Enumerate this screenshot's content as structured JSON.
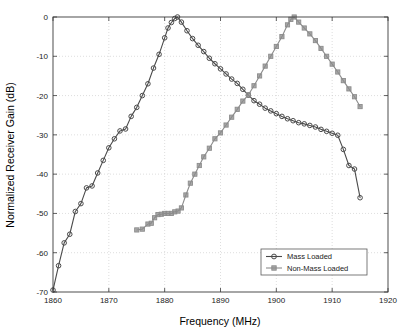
{
  "chart_data": {
    "type": "line",
    "title": "",
    "xlabel": "Frequency (MHz)",
    "ylabel": "Normalized Receiver Gain (dB)",
    "xlim": [
      1860,
      1920
    ],
    "ylim": [
      -70,
      0
    ],
    "xticks": [
      1860,
      1870,
      1880,
      1890,
      1900,
      1910,
      1920
    ],
    "yticks": [
      0,
      -10,
      -20,
      -30,
      -40,
      -50,
      -60,
      -70
    ],
    "xtick_labels": [
      "1860",
      "1870",
      "1880",
      "1890",
      "1900",
      "1910",
      "1920"
    ],
    "ytick_labels": [
      "0",
      "-10",
      "-20",
      "-30",
      "-40",
      "-50",
      "-60",
      "-70"
    ],
    "grid": true,
    "legend_position": "lower right",
    "series": [
      {
        "name": "Mass Loaded",
        "marker": "circle",
        "color": "#4a4a4a",
        "x": [
          1860.0,
          1861.0,
          1862.0,
          1863.0,
          1864.0,
          1865.0,
          1866.0,
          1867.0,
          1868.0,
          1869.0,
          1870.0,
          1871.0,
          1872.0,
          1873.0,
          1874.0,
          1875.0,
          1876.0,
          1877.0,
          1878.0,
          1879.0,
          1880.0,
          1880.6,
          1881.2,
          1881.8,
          1882.3,
          1883.0,
          1884.0,
          1885.0,
          1886.0,
          1887.0,
          1888.0,
          1889.0,
          1890.0,
          1891.0,
          1892.0,
          1893.0,
          1894.0,
          1895.0,
          1896.0,
          1897.0,
          1898.0,
          1899.0,
          1900.0,
          1901.0,
          1902.0,
          1903.0,
          1904.0,
          1905.0,
          1906.0,
          1907.0,
          1908.0,
          1909.0,
          1910.0,
          1911.0,
          1912.0,
          1913.0,
          1914.0,
          1915.0
        ],
        "y": [
          -69.5,
          -63.3,
          -57.5,
          -55.3,
          -49.5,
          -47.5,
          -43.5,
          -43.0,
          -39.7,
          -36.5,
          -33.3,
          -31.0,
          -29.0,
          -28.5,
          -25.3,
          -23.0,
          -20.0,
          -17.0,
          -13.0,
          -9.5,
          -5.3,
          -2.8,
          -1.4,
          -0.4,
          0.0,
          -1.3,
          -3.5,
          -5.5,
          -7.2,
          -8.8,
          -10.5,
          -11.9,
          -13.2,
          -14.5,
          -15.8,
          -16.9,
          -18.4,
          -19.9,
          -21.3,
          -22.2,
          -23.2,
          -23.9,
          -24.6,
          -25.3,
          -25.9,
          -26.4,
          -26.9,
          -27.2,
          -27.6,
          -28.0,
          -28.6,
          -29.1,
          -29.6,
          -30.1,
          -33.7,
          -37.8,
          -38.7,
          -46.0
        ]
      },
      {
        "name": "Non-Mass Loaded",
        "marker": "square",
        "color": "#8c8c8c",
        "x": [
          1875.0,
          1876.0,
          1877.0,
          1877.6,
          1878.2,
          1878.8,
          1879.4,
          1880.0,
          1880.6,
          1881.2,
          1881.8,
          1882.4,
          1883.0,
          1883.8,
          1884.6,
          1885.4,
          1886.2,
          1887.0,
          1888.0,
          1889.0,
          1890.0,
          1891.0,
          1892.0,
          1893.0,
          1894.0,
          1895.0,
          1896.0,
          1897.0,
          1898.0,
          1899.0,
          1900.0,
          1901.0,
          1902.0,
          1902.6,
          1903.2,
          1904.0,
          1905.0,
          1906.0,
          1907.0,
          1908.0,
          1909.0,
          1910.0,
          1911.0,
          1912.0,
          1913.0,
          1914.0,
          1915.0
        ],
        "y": [
          -54.2,
          -54.0,
          -52.7,
          -52.5,
          -51.1,
          -50.3,
          -50.2,
          -50.0,
          -50.0,
          -50.0,
          -49.6,
          -49.4,
          -48.6,
          -45.3,
          -42.3,
          -40.0,
          -37.8,
          -35.6,
          -33.4,
          -31.0,
          -29.5,
          -27.5,
          -25.5,
          -23.5,
          -21.4,
          -19.8,
          -17.5,
          -15.0,
          -12.5,
          -10.0,
          -7.5,
          -5.0,
          -2.0,
          -0.6,
          0.0,
          -1.3,
          -2.8,
          -4.3,
          -6.0,
          -8.0,
          -10.0,
          -12.0,
          -14.0,
          -16.2,
          -18.3,
          -20.3,
          -22.8
        ]
      }
    ]
  },
  "legend": {
    "items": [
      {
        "label": "Mass Loaded",
        "marker": "circle-marker",
        "color": "#4a4a4a"
      },
      {
        "label": "Non-Mass Loaded",
        "marker": "square-marker",
        "color": "#8c8c8c"
      }
    ]
  },
  "axes": {
    "x_title": "Frequency (MHz)",
    "y_title": "Normalized Receiver Gain (dB)"
  }
}
